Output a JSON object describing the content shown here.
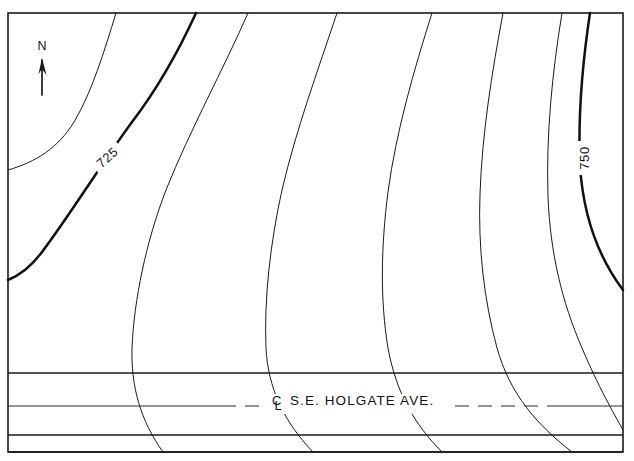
{
  "map": {
    "title": "Topographic contour map with street",
    "background_color": "#ffffff",
    "line_color": "#1a1a1a",
    "frame": {
      "x": 8,
      "y": 13,
      "width": 615,
      "height": 439
    }
  },
  "north_arrow": {
    "label": "N",
    "icon": "north-arrow-icon",
    "x": 42,
    "y_label": 50,
    "y_tip": 58,
    "y_tail": 95
  },
  "street": {
    "name": "S.E. HOLGATE AVE.",
    "centerline_symbol": "℄",
    "full_label": "℄ S.E. HOLGATE AVE.",
    "label_x": 355,
    "label_y": 406,
    "upper_curb_y": 373,
    "centerline_y": 406,
    "lower_curb_y": 435,
    "lower_edge_y": 452
  },
  "chart_data": {
    "type": "line",
    "xlabel": "",
    "ylabel": "",
    "grid": false,
    "legend": "none",
    "contour_interval": 5,
    "labeled_contours": [
      "725",
      "750"
    ],
    "units": "feet",
    "contours": [
      {
        "id": "c1",
        "elevation": null,
        "label": "",
        "weight": "thin",
        "path": "M 116,13 C 104,52 92,92 74,122 C 58,148 36,162 8,170",
        "entry": "top",
        "exit": "left"
      },
      {
        "id": "c2",
        "elevation": "725",
        "label": "725",
        "weight": "bold",
        "label_x": 107,
        "label_y": 157,
        "label_rotation": -42,
        "path": "M 196,13 C 180,48 158,88 132,122 C 104,160 70,215 42,252 C 30,268 18,276 8,280",
        "entry": "top",
        "exit": "left"
      },
      {
        "id": "c3",
        "elevation": null,
        "label": "",
        "weight": "thin",
        "path": "M 248,13 C 224,68 190,130 166,190 C 146,242 134,300 132,348 C 131,386 140,420 163,452",
        "entry": "top",
        "exit": "bottom"
      },
      {
        "id": "c4",
        "elevation": null,
        "label": "",
        "weight": "thin",
        "path": "M 337,13 C 318,70 296,130 282,190 C 270,244 264,300 266,348 C 268,388 284,422 313,452",
        "entry": "top",
        "exit": "bottom"
      },
      {
        "id": "c5",
        "elevation": null,
        "label": "",
        "weight": "thin",
        "path": "M 432,13 C 414,70 396,132 388,192 C 381,246 380,300 388,348 C 396,392 414,424 442,452",
        "entry": "top",
        "exit": "bottom"
      },
      {
        "id": "c6",
        "elevation": null,
        "label": "",
        "weight": "thin",
        "path": "M 503,13 C 492,72 482,134 480,194 C 478,248 484,300 497,348 C 510,394 536,424 572,452",
        "entry": "top",
        "exit": "bottom"
      },
      {
        "id": "c7",
        "elevation": null,
        "label": "",
        "weight": "thin",
        "path": "M 562,13 C 552,74 546,136 548,196 C 550,252 562,302 582,348 C 598,386 614,414 623,430",
        "entry": "top",
        "exit": "right"
      },
      {
        "id": "c8",
        "elevation": "750",
        "label": "750",
        "weight": "bold",
        "label_x": 584,
        "label_y": 158,
        "label_rotation": -90,
        "path": "M 590,13 C 582,66 578,120 580,166 C 583,212 596,254 623,290",
        "entry": "top",
        "exit": "right"
      }
    ]
  }
}
